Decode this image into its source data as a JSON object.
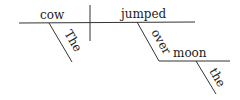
{
  "diagram": {
    "type": "sentence-diagram",
    "subject": "cow",
    "subject_modifier": "The",
    "verb": "jumped",
    "preposition": "over",
    "prep_object": "moon",
    "prep_object_modifier": "the"
  }
}
